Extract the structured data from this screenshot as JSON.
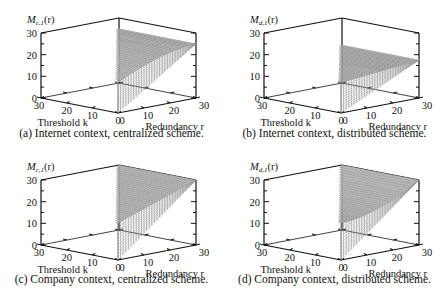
{
  "figure": {
    "panels": [
      {
        "id": "a",
        "zlabel": "M_{c,1}(r)",
        "zlabel_main": "M",
        "zlabel_sub": "c,1",
        "zlabel_tail": "(r)",
        "caption": "(a) Internet context, centralized scheme."
      },
      {
        "id": "b",
        "zlabel": "M_{d,1}(r)",
        "zlabel_main": "M",
        "zlabel_sub": "d,1",
        "zlabel_tail": "(r)",
        "caption": "(b) Internet context, distributed scheme."
      },
      {
        "id": "c",
        "zlabel": "M_{c,1}(r)",
        "zlabel_main": "M",
        "zlabel_sub": "c,1",
        "zlabel_tail": "(r)",
        "caption": "(c) Company context, centralized scheme."
      },
      {
        "id": "d",
        "zlabel": "M_{d,1}(r)",
        "zlabel_main": "M",
        "zlabel_sub": "d,1",
        "zlabel_tail": "(r)",
        "caption": "(d) Company context, distributed scheme."
      }
    ],
    "axes": {
      "k_label": "Threshold k",
      "r_label": "Redundancy r",
      "z_ticks": [
        "0",
        "10",
        "20",
        "30"
      ],
      "k_ticks": [
        "30",
        "20",
        "10",
        "0"
      ],
      "r_ticks": [
        "0",
        "10",
        "20",
        "30"
      ]
    }
  },
  "chart_data": [
    {
      "type": "surface3d",
      "title": "(a) Internet context, centralized scheme.",
      "xlabel": "Threshold k",
      "ylabel": "Redundancy r",
      "zlabel": "M_{c,1}(r)",
      "xlim": [
        0,
        30
      ],
      "ylim": [
        0,
        30
      ],
      "zlim": [
        0,
        30
      ],
      "description": "Surface defined for r >= k; rises with r, concave, reaching ~25 at r=30; at k=r=0 front edge spans 0 to ~14",
      "samples": {
        "r": [
          0,
          10,
          20,
          30
        ],
        "z_at_k0": [
          14,
          19,
          23,
          25
        ]
      }
    },
    {
      "type": "surface3d",
      "title": "(b) Internet context, distributed scheme.",
      "xlabel": "Threshold k",
      "ylabel": "Redundancy r",
      "zlabel": "M_{d,1}(r)",
      "xlim": [
        0,
        30
      ],
      "ylim": [
        0,
        30
      ],
      "zlim": [
        0,
        30
      ],
      "description": "Nearly flat/slowly rising surface around 14-18 over r; planar wedge",
      "samples": {
        "r": [
          0,
          10,
          20,
          30
        ],
        "z_at_k0": [
          14,
          15,
          16,
          17
        ]
      }
    },
    {
      "type": "surface3d",
      "title": "(c) Company context, centralized scheme.",
      "xlabel": "Threshold k",
      "ylabel": "Redundancy r",
      "zlabel": "M_{c,1}(r)",
      "xlim": [
        0,
        30
      ],
      "ylim": [
        0,
        30
      ],
      "zlim": [
        0,
        30
      ],
      "description": "Surface rising roughly linearly from ~17 to ~30 at r=30",
      "samples": {
        "r": [
          0,
          10,
          20,
          30
        ],
        "z_at_k0": [
          17,
          21,
          26,
          30
        ]
      }
    },
    {
      "type": "surface3d",
      "title": "(d) Company context, distributed scheme.",
      "xlabel": "Threshold k",
      "ylabel": "Redundancy r",
      "zlabel": "M_{d,1}(r)",
      "xlim": [
        0,
        30
      ],
      "ylim": [
        0,
        30
      ],
      "zlim": [
        0,
        30
      ],
      "description": "Convex surface starting ~17, dipping slightly then rising to ~30 at r=30",
      "samples": {
        "r": [
          0,
          10,
          20,
          30
        ],
        "z_at_k0": [
          17,
          18,
          23,
          30
        ]
      }
    }
  ]
}
